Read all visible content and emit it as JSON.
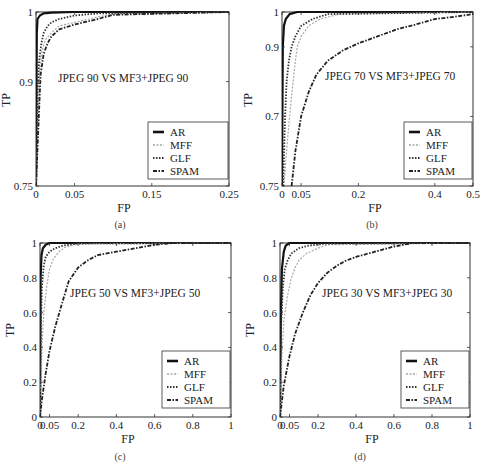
{
  "chart_data": [
    {
      "id": "a",
      "type": "line",
      "caption": "(a)",
      "title": "JPEG 90 VS MF3+JPEG 90",
      "xlabel": "FP",
      "ylabel": "TP",
      "xlim": [
        0,
        0.25
      ],
      "ylim": [
        0.75,
        1
      ],
      "xticks": [
        "0",
        "0.05",
        "0.15",
        "0.25"
      ],
      "xtick_values": [
        0,
        0.05,
        0.15,
        0.25
      ],
      "yticks": [
        "0.75",
        "0.9",
        "1"
      ],
      "ytick_values": [
        0.75,
        0.9,
        1
      ],
      "legend": [
        "AR",
        "MFF",
        "GLF",
        "SPAM"
      ],
      "legend_position": "lower right",
      "grid": false,
      "series": [
        {
          "name": "AR",
          "x": [
            0,
            0.001,
            0.002,
            0.005,
            0.01,
            0.02,
            0.05,
            0.1,
            0.25
          ],
          "y": [
            0.75,
            0.97,
            0.99,
            0.995,
            0.998,
            0.999,
            1,
            1,
            1
          ]
        },
        {
          "name": "MFF",
          "x": [
            0,
            0.003,
            0.005,
            0.008,
            0.012,
            0.02,
            0.03,
            0.05,
            0.08,
            0.1,
            0.25
          ],
          "y": [
            0.75,
            0.85,
            0.92,
            0.945,
            0.96,
            0.97,
            0.98,
            0.985,
            0.993,
            0.997,
            1
          ]
        },
        {
          "name": "GLF",
          "x": [
            0,
            0.002,
            0.004,
            0.007,
            0.01,
            0.015,
            0.02,
            0.03,
            0.05,
            0.08,
            0.25
          ],
          "y": [
            0.75,
            0.88,
            0.93,
            0.955,
            0.97,
            0.98,
            0.985,
            0.99,
            0.995,
            0.998,
            1
          ]
        },
        {
          "name": "SPAM",
          "x": [
            0,
            0.004,
            0.006,
            0.01,
            0.015,
            0.02,
            0.03,
            0.05,
            0.08,
            0.1,
            0.25
          ],
          "y": [
            0.75,
            0.86,
            0.91,
            0.94,
            0.955,
            0.965,
            0.975,
            0.982,
            0.99,
            0.996,
            1
          ]
        }
      ]
    },
    {
      "id": "b",
      "type": "line",
      "caption": "(b)",
      "title": "JPEG 70 VS MF3+JPEG 70",
      "xlabel": "FP",
      "ylabel": "TP",
      "xlim": [
        0,
        0.5
      ],
      "ylim": [
        0.75,
        1
      ],
      "xticks": [
        "0",
        "0.05",
        "0.2",
        "0.4",
        "0.5"
      ],
      "xtick_values": [
        0,
        0.05,
        0.2,
        0.4,
        0.5
      ],
      "yticks": [
        "0.75",
        "0.7",
        "0.9",
        "1"
      ],
      "ytick_values": [
        0.75,
        0.85,
        0.95,
        1
      ],
      "legend": [
        "AR",
        "MFF",
        "GLF",
        "SPAM"
      ],
      "legend_position": "lower right",
      "grid": false,
      "series": [
        {
          "name": "AR",
          "x": [
            0,
            0.002,
            0.005,
            0.01,
            0.02,
            0.04,
            0.5
          ],
          "y": [
            0.75,
            0.95,
            0.98,
            0.99,
            0.997,
            1,
            1
          ]
        },
        {
          "name": "MFF",
          "x": [
            0.005,
            0.015,
            0.025,
            0.035,
            0.04,
            0.05,
            0.07,
            0.1,
            0.15,
            0.5
          ],
          "y": [
            0.75,
            0.82,
            0.88,
            0.93,
            0.95,
            0.965,
            0.98,
            0.99,
            0.997,
            1
          ]
        },
        {
          "name": "GLF",
          "x": [
            0.003,
            0.008,
            0.012,
            0.018,
            0.025,
            0.035,
            0.05,
            0.08,
            0.12,
            0.5
          ],
          "y": [
            0.75,
            0.85,
            0.9,
            0.93,
            0.95,
            0.965,
            0.98,
            0.99,
            0.997,
            1
          ]
        },
        {
          "name": "SPAM",
          "x": [
            0.025,
            0.035,
            0.05,
            0.07,
            0.09,
            0.12,
            0.16,
            0.2,
            0.25,
            0.3,
            0.35,
            0.4,
            0.45,
            0.5
          ],
          "y": [
            0.75,
            0.8,
            0.85,
            0.885,
            0.91,
            0.93,
            0.945,
            0.955,
            0.965,
            0.975,
            0.982,
            0.99,
            0.993,
            0.997
          ]
        }
      ]
    },
    {
      "id": "c",
      "type": "line",
      "caption": "(c)",
      "title": "JPEG 50 VS MF3+JPEG 50",
      "xlabel": "FP",
      "ylabel": "TP",
      "xlim": [
        0,
        1
      ],
      "ylim": [
        0,
        1
      ],
      "xticks": [
        "0",
        "0.05",
        "0.2",
        "0.4",
        "0.6",
        "0.8",
        "1"
      ],
      "xtick_values": [
        0,
        0.05,
        0.2,
        0.4,
        0.6,
        0.8,
        1
      ],
      "yticks": [
        "0",
        "0.2",
        "0.4",
        "0.6",
        "0.8",
        "1"
      ],
      "ytick_values": [
        0,
        0.2,
        0.4,
        0.6,
        0.8,
        1
      ],
      "legend": [
        "AR",
        "MFF",
        "GLF",
        "SPAM"
      ],
      "legend_position": "lower right",
      "grid": false,
      "series": [
        {
          "name": "AR",
          "x": [
            0,
            0.003,
            0.008,
            0.015,
            0.03,
            0.05,
            1
          ],
          "y": [
            0,
            0.8,
            0.93,
            0.97,
            0.99,
            1,
            1
          ]
        },
        {
          "name": "MFF",
          "x": [
            0,
            0.01,
            0.02,
            0.035,
            0.05,
            0.07,
            0.1,
            0.13,
            0.2,
            1
          ],
          "y": [
            0,
            0.4,
            0.6,
            0.75,
            0.85,
            0.91,
            0.95,
            0.975,
            0.995,
            1
          ]
        },
        {
          "name": "GLF",
          "x": [
            0,
            0.005,
            0.01,
            0.02,
            0.03,
            0.05,
            0.08,
            0.12,
            0.2,
            1
          ],
          "y": [
            0,
            0.55,
            0.75,
            0.87,
            0.92,
            0.95,
            0.97,
            0.985,
            0.997,
            1
          ]
        },
        {
          "name": "SPAM",
          "x": [
            0,
            0.01,
            0.03,
            0.05,
            0.08,
            0.12,
            0.15,
            0.2,
            0.25,
            0.3,
            0.4,
            0.5,
            0.6,
            0.7,
            1
          ],
          "y": [
            0,
            0.1,
            0.25,
            0.38,
            0.52,
            0.67,
            0.78,
            0.86,
            0.9,
            0.93,
            0.95,
            0.97,
            0.99,
            1,
            1
          ]
        }
      ]
    },
    {
      "id": "d",
      "type": "line",
      "caption": "(d)",
      "title": "JPEG 30 VS MF3+JPEG 30",
      "xlabel": "FP",
      "ylabel": "TP",
      "xlim": [
        0,
        1
      ],
      "ylim": [
        0,
        1
      ],
      "xticks": [
        "0",
        "0.05",
        "0.2",
        "0.4",
        "0.6",
        "0.8",
        "1"
      ],
      "xtick_values": [
        0,
        0.05,
        0.2,
        0.4,
        0.6,
        0.8,
        1
      ],
      "yticks": [
        "0",
        "0.2",
        "0.4",
        "0.6",
        "0.8",
        "1"
      ],
      "ytick_values": [
        0,
        0.2,
        0.4,
        0.6,
        0.8,
        1
      ],
      "legend": [
        "AR",
        "MFF",
        "GLF",
        "SPAM"
      ],
      "legend_position": "lower right",
      "grid": false,
      "series": [
        {
          "name": "AR",
          "x": [
            0,
            0.005,
            0.01,
            0.02,
            0.03,
            0.05,
            1
          ],
          "y": [
            0,
            0.6,
            0.85,
            0.95,
            0.985,
            1,
            1
          ]
        },
        {
          "name": "MFF",
          "x": [
            0,
            0.01,
            0.02,
            0.04,
            0.06,
            0.08,
            0.1,
            0.14,
            0.2,
            0.25,
            1
          ],
          "y": [
            0,
            0.35,
            0.55,
            0.7,
            0.8,
            0.86,
            0.9,
            0.94,
            0.97,
            0.99,
            1
          ]
        },
        {
          "name": "GLF",
          "x": [
            0,
            0.005,
            0.015,
            0.025,
            0.04,
            0.06,
            0.1,
            0.15,
            0.25,
            1
          ],
          "y": [
            0,
            0.5,
            0.75,
            0.85,
            0.9,
            0.94,
            0.97,
            0.985,
            0.997,
            1
          ]
        },
        {
          "name": "SPAM",
          "x": [
            0,
            0.02,
            0.05,
            0.08,
            0.12,
            0.16,
            0.2,
            0.25,
            0.3,
            0.35,
            0.4,
            0.5,
            0.6,
            0.7,
            1
          ],
          "y": [
            0,
            0.18,
            0.35,
            0.48,
            0.6,
            0.7,
            0.77,
            0.83,
            0.87,
            0.9,
            0.92,
            0.95,
            0.98,
            1,
            1
          ]
        }
      ]
    }
  ],
  "layout": {
    "panels": [
      {
        "x0": 36,
        "y0": 12,
        "x1": 229,
        "y1": 186,
        "legend": {
          "x": 148,
          "y": 122,
          "w": 80,
          "h": 57
        },
        "title_pos": {
          "x": 58,
          "y": 82
        },
        "caption_pos": {
          "x": 120,
          "y": 228
        },
        "xlabel_pos": {
          "x": 124,
          "y": 212
        },
        "ylabel_pos": {
          "x": 10,
          "y": 100
        }
      },
      {
        "x0": 282,
        "y0": 12,
        "x1": 473,
        "y1": 186,
        "legend": {
          "x": 404,
          "y": 122,
          "w": 68,
          "h": 57
        },
        "title_pos": {
          "x": 325,
          "y": 80
        },
        "caption_pos": {
          "x": 372,
          "y": 228
        },
        "xlabel_pos": {
          "x": 375,
          "y": 212
        },
        "ylabel_pos": {
          "x": 252,
          "y": 100
        }
      },
      {
        "x0": 40,
        "y0": 243,
        "x1": 231,
        "y1": 417,
        "legend": {
          "x": 162,
          "y": 351,
          "w": 68,
          "h": 57
        },
        "title_pos": {
          "x": 70,
          "y": 297
        },
        "caption_pos": {
          "x": 120,
          "y": 460
        },
        "xlabel_pos": {
          "x": 128,
          "y": 443
        },
        "ylabel_pos": {
          "x": 14,
          "y": 330
        }
      },
      {
        "x0": 280,
        "y0": 243,
        "x1": 470,
        "y1": 417,
        "legend": {
          "x": 401,
          "y": 351,
          "w": 68,
          "h": 57
        },
        "title_pos": {
          "x": 322,
          "y": 297
        },
        "caption_pos": {
          "x": 360,
          "y": 460
        },
        "xlabel_pos": {
          "x": 372,
          "y": 443
        },
        "ylabel_pos": {
          "x": 254,
          "y": 330
        }
      }
    ]
  },
  "styles": {
    "AR": {
      "color": "#111111",
      "width": 2.2,
      "dash": ""
    },
    "MFF": {
      "color": "#a8a8a8",
      "width": 1.2,
      "dash": "2,1.5"
    },
    "GLF": {
      "color": "#333333",
      "width": 1.8,
      "dash": "1.5,1.5"
    },
    "SPAM": {
      "color": "#222222",
      "width": 1.8,
      "dash": "4,1.5,1.5,1.5"
    }
  }
}
